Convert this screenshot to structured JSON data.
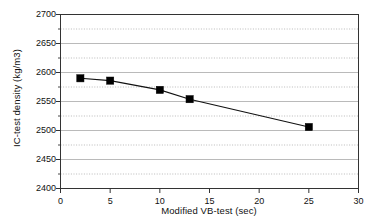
{
  "chart_data": {
    "type": "line",
    "title": "",
    "xlabel": "Modified VB-test (sec)",
    "ylabel": "IC-test density (kg/m3)",
    "xlim": [
      0,
      30
    ],
    "ylim": [
      2400,
      2700
    ],
    "xticks": [
      0,
      5,
      10,
      15,
      20,
      25,
      30
    ],
    "yticks": [
      2400,
      2450,
      2500,
      2550,
      2600,
      2650,
      2700
    ],
    "y_minor_ticks": [
      2425,
      2475,
      2525,
      2575,
      2625,
      2675
    ],
    "grid": "horizontal-dotted-minor-and-major",
    "legend": "none",
    "marker": "filled-square",
    "series": [
      {
        "name": "IC-test density",
        "x": [
          2,
          5,
          10,
          13,
          25
        ],
        "values": [
          2590,
          2586,
          2570,
          2554,
          2506
        ]
      }
    ]
  },
  "axes": {
    "x_tick_labels": [
      "0",
      "5",
      "10",
      "15",
      "20",
      "25",
      "30"
    ],
    "y_tick_labels": [
      "2400",
      "2450",
      "2500",
      "2550",
      "2600",
      "2650",
      "2700"
    ],
    "x_axis_title": "Modified VB-test (sec)",
    "y_axis_title": "IC-test density (kg/m3)"
  },
  "colors": {
    "background": "#ffffff",
    "axis": "#333333",
    "gridline": "#a8a8a8",
    "series_line": "#111111",
    "marker_fill": "#000000"
  }
}
